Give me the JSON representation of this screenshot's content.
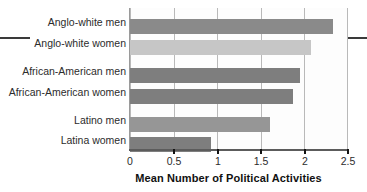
{
  "chart_data": {
    "type": "bar",
    "orientation": "horizontal",
    "title": "",
    "xlabel": "Mean Number of Political Activities",
    "ylabel": "",
    "xlim": [
      0,
      2.5
    ],
    "xticks": [
      "0",
      "0.5",
      "1",
      "1.5",
      "2",
      "2.5"
    ],
    "xtick_values": [
      0,
      0.5,
      1,
      1.5,
      2,
      2.5
    ],
    "grid": "vertical",
    "legend": "none",
    "categories": [
      "Anglo-white men",
      "Anglo-white women",
      "African-American men",
      "African-American women",
      "Latino men",
      "Latina women"
    ],
    "values": [
      2.33,
      2.07,
      1.95,
      1.87,
      1.6,
      0.93
    ],
    "bar_colors": [
      "#8a8a8a",
      "#c6c6c6",
      "#7e7e7e",
      "#7e7e7e",
      "#969696",
      "#7e7e7e"
    ],
    "groups": [
      {
        "name": "Anglo-white",
        "categories": [
          "Anglo-white men",
          "Anglo-white women"
        ]
      },
      {
        "name": "African-American",
        "categories": [
          "African-American men",
          "African-American women"
        ]
      },
      {
        "name": "Latino",
        "categories": [
          "Latino men",
          "Latina women"
        ]
      }
    ]
  },
  "colors": {
    "bar_dark": "#7e7e7e",
    "bar_mid": "#8a8a8a",
    "bar_light": "#c6c6c6",
    "gridline": "#b9b9b9",
    "axis": "#5c5c5c",
    "text": "#2c2c2c",
    "rule": "#3a3a3a"
  }
}
